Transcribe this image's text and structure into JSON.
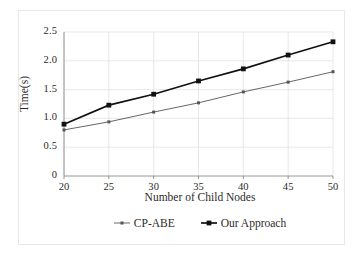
{
  "chart_data": {
    "type": "line",
    "title": "",
    "xlabel": "Number of Child Nodes",
    "ylabel": "Time(s)",
    "x": [
      20,
      25,
      30,
      35,
      40,
      45,
      50
    ],
    "categories": [
      "20",
      "25",
      "30",
      "35",
      "40",
      "45",
      "50"
    ],
    "xtick_labels": [
      "20",
      "25",
      "30",
      "35",
      "40",
      "45",
      "50"
    ],
    "ytick_labels": [
      "0",
      "0.5",
      "1.0",
      "1.5",
      "2.0",
      "2.5"
    ],
    "ytick_values": [
      0,
      0.5,
      1.0,
      1.5,
      2.0,
      2.5
    ],
    "xlim": [
      20,
      50
    ],
    "ylim": [
      0,
      2.5
    ],
    "grid": true,
    "legend_position": "below-axis-center",
    "series": [
      {
        "name": "CP-ABE",
        "color": "#555555",
        "marker": "square",
        "values": [
          0.8,
          0.94,
          1.11,
          1.27,
          1.46,
          1.63,
          1.81
        ]
      },
      {
        "name": "Our Approach",
        "color": "#111111",
        "marker": "square",
        "values": [
          0.9,
          1.23,
          1.42,
          1.65,
          1.86,
          2.1,
          2.33
        ]
      }
    ]
  },
  "axes": {
    "gridline_color": "#e2e2e2",
    "axis_color": "#8a8a8a"
  },
  "legend": {
    "entries": [
      {
        "label": "CP-ABE"
      },
      {
        "label": "Our Approach"
      }
    ]
  }
}
